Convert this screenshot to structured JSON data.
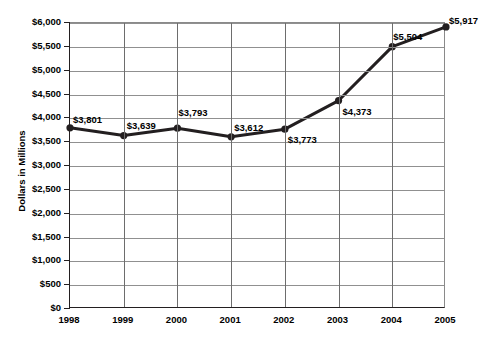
{
  "chart_data": {
    "type": "line",
    "title": "",
    "xlabel": "",
    "ylabel": "Dollars in Millions",
    "categories": [
      "1998",
      "1999",
      "2000",
      "2001",
      "2002",
      "2003",
      "2004",
      "2005"
    ],
    "values": [
      3801,
      3639,
      3793,
      3612,
      3773,
      4373,
      5504,
      5917
    ],
    "point_labels": [
      "$3,801",
      "$3,639",
      "$3,793",
      "$3,612",
      "$3,773",
      "$4,373",
      "$5,504",
      "$5,917"
    ],
    "ylim": [
      0,
      6000
    ],
    "ytick_values": [
      0,
      500,
      1000,
      1500,
      2000,
      2500,
      3000,
      3500,
      4000,
      4500,
      5000,
      5500,
      6000
    ],
    "ytick_labels": [
      "$0",
      "$500",
      "$1,000",
      "$1,500",
      "$2,000",
      "$2,500",
      "$3,000",
      "$3,500",
      "$4,000",
      "$4,500",
      "$5,000",
      "$5,500",
      "$6,000"
    ],
    "grid": {
      "horizontal": true,
      "vertical": true
    },
    "legend": {
      "visible": false,
      "position": "none"
    },
    "series_color": "#231f20",
    "grid_color": "#909090",
    "axis_color": "#231f20",
    "marker": "circle",
    "label_offsets": [
      {
        "dx": 4,
        "dy": -13
      },
      {
        "dx": 4,
        "dy": -15
      },
      {
        "dx": 2,
        "dy": -20
      },
      {
        "dx": 4,
        "dy": -14
      },
      {
        "dx": 4,
        "dy": 6
      },
      {
        "dx": 5,
        "dy": 6
      },
      {
        "dx": 2,
        "dy": -15
      },
      {
        "dx": 4,
        "dy": -11
      }
    ]
  }
}
